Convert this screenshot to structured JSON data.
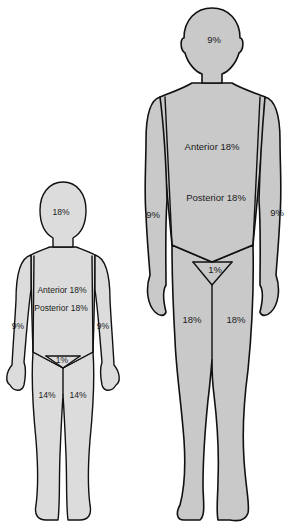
{
  "diagram": {
    "colors": {
      "adult_fill": "#c9c9c9",
      "child_fill": "#dcdcdc",
      "outline": "#111111",
      "background": "#ffffff"
    },
    "adult": {
      "head": "9%",
      "trunk_anterior": "Anterior 18%",
      "trunk_posterior": "Posterior 18%",
      "left_arm": "9%",
      "right_arm": "9%",
      "perineum": "1%",
      "left_leg": "18%",
      "right_leg": "18%"
    },
    "child": {
      "head": "18%",
      "trunk_anterior": "Anterior 18%",
      "trunk_posterior": "Posterior 18%",
      "left_arm": "9%",
      "right_arm": "9%",
      "perineum": "1%",
      "left_leg": "14%",
      "right_leg": "14%"
    }
  }
}
